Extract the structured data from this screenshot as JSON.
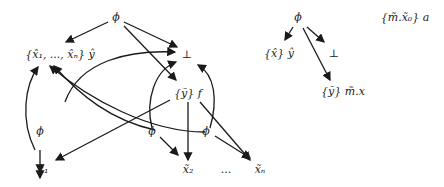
{
  "diagram": {
    "left": {
      "nodes": {
        "phi_top": "ϕ",
        "set_xhat": "{x̂₁, ..., x̂ₙ} ŷ",
        "bottom": "⊥",
        "set_ytilde_f": "{ỹ} f",
        "phi_1": "ϕ",
        "phi_2": "ϕ",
        "phi_3": "ϕ",
        "x1": "x̃₁",
        "x2": "x̃₂",
        "dots": "...",
        "xn": "x̃ₙ"
      }
    },
    "right": {
      "nodes": {
        "phi_top": "ϕ",
        "set_xhat_y": "{x̂} ŷ",
        "bottom": "⊥",
        "set_y_mx": "{ỹ} m̃.x",
        "set_mx0_a": "{m̃.x̃₀} a"
      }
    },
    "colors": {
      "stroke": "#1a1a1a",
      "text": "#222222"
    }
  }
}
